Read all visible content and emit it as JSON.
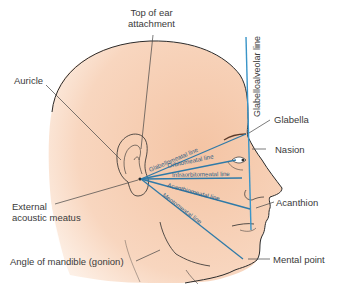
{
  "diagram": {
    "colors": {
      "skin": "#f6cdb0",
      "skin_light": "#fbe3d2",
      "outline": "#2b2b2b",
      "positioning_line": "#2f7aa8",
      "glabelloalveolar_line": "#3a95c8",
      "leader_line": "#444444",
      "label_text": "#3a3a3a"
    },
    "labels": {
      "top_of_ear_attachment_1": "Top of ear",
      "top_of_ear_attachment_2": "attachment",
      "auricle": "Auricle",
      "glabella": "Glabella",
      "nasion": "Nasion",
      "external_acoustic_meatus_1": "External",
      "external_acoustic_meatus_2": "acoustic meatus",
      "acanthion": "Acanthion",
      "angle_of_mandible": "Angle of mandible (gonion)",
      "mental_point": "Mental point",
      "glabelloalveolar_line": "Glabelloalveolar line"
    },
    "positioning_lines": [
      {
        "name": "Glabellomeatal line"
      },
      {
        "name": "Orbitomeatal line"
      },
      {
        "name": "Infraorbitomeatal line"
      },
      {
        "name": "Acanthiomeatal line"
      },
      {
        "name": "Mentomeatal line"
      }
    ]
  }
}
